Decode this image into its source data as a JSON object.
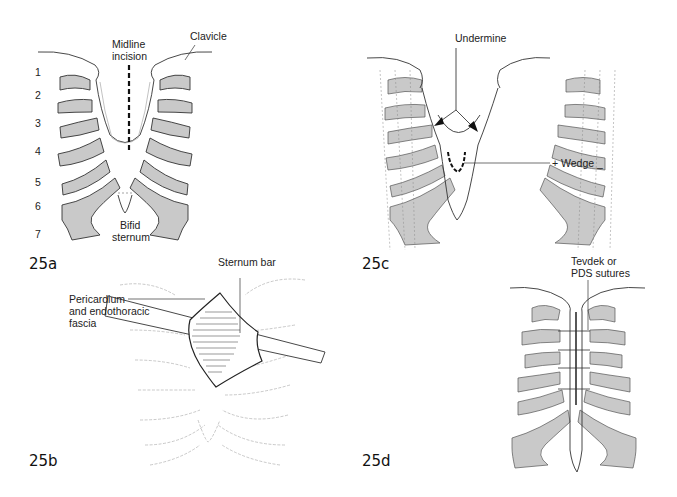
{
  "colors": {
    "rib_fill": "#c9c9c9",
    "line": "#333333",
    "faint_line": "#9a9a9a",
    "background": "#ffffff"
  },
  "panels": {
    "a": {
      "figure_label": "25a",
      "labels": {
        "midline": "Midline",
        "incision": "incision",
        "clavicle": "Clavicle",
        "bifid": "Bifid",
        "sternum": "sternum"
      },
      "rib_numbers": [
        "1",
        "2",
        "3",
        "4",
        "5",
        "6",
        "7"
      ]
    },
    "b": {
      "figure_label": "25b",
      "labels": {
        "sternum_bar": "Sternum bar",
        "pericardium_1": "Pericardium",
        "pericardium_2": "and endothoracic",
        "pericardium_3": "fascia"
      }
    },
    "c": {
      "figure_label": "25c",
      "labels": {
        "undermine": "Undermine",
        "wedge": "+ Wedge _"
      }
    },
    "d": {
      "figure_label": "25d",
      "labels": {
        "sutures_1": "Tevdek or",
        "sutures_2": "PDS sutures"
      }
    }
  }
}
